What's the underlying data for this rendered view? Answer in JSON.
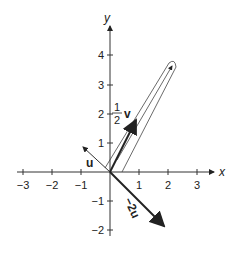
{
  "diagram": {
    "axes": {
      "x_label": "x",
      "y_label": "y",
      "x_ticks": [
        {
          "value": -3,
          "label": "−3"
        },
        {
          "value": -2,
          "label": "−2"
        },
        {
          "value": -1,
          "label": "−1"
        },
        {
          "value": 1,
          "label": "1"
        },
        {
          "value": 2,
          "label": "2"
        },
        {
          "value": 3,
          "label": "3"
        }
      ],
      "y_ticks": [
        {
          "value": 4,
          "label": "4"
        },
        {
          "value": 3,
          "label": "3"
        },
        {
          "value": 2,
          "label": "2"
        },
        {
          "value": 1,
          "label": "1"
        },
        {
          "value": -1,
          "label": "−1"
        },
        {
          "value": -2,
          "label": "−2"
        }
      ]
    },
    "vectors": [
      {
        "name": "u",
        "label": "u",
        "tip": [
          -0.7,
          0.7
        ],
        "style": "thin"
      },
      {
        "name": "half-v",
        "label_num": "1",
        "label_den": "2",
        "label_var": "v",
        "tip": [
          0.9,
          1.8
        ],
        "style": "bold"
      },
      {
        "name": "neg-2u",
        "label": "−2u",
        "tip": [
          1.9,
          -1.9
        ],
        "style": "bold"
      },
      {
        "name": "v-sum",
        "tip": [
          2.2,
          3.8
        ],
        "style": "outline"
      }
    ],
    "colors": {
      "ink": "#222222",
      "background": "#ffffff"
    }
  }
}
